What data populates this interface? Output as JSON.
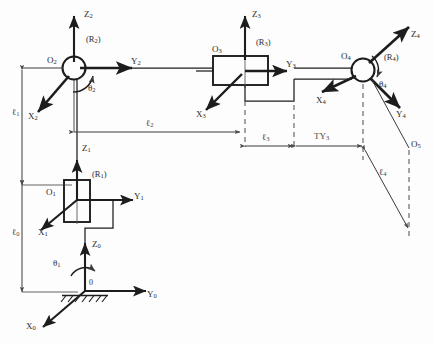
{
  "figure": {
    "type": "kinematic-diagram",
    "title": ""
  },
  "frames": [
    {
      "name": "R0",
      "label": "",
      "origin_label": "0",
      "axes": {
        "x": "X",
        "y": "Y",
        "z": "Z"
      },
      "sub": "0"
    },
    {
      "name": "R1",
      "label": "(R",
      "origin_label": "O",
      "sub": "1"
    },
    {
      "name": "R2",
      "label": "(R",
      "origin_label": "O",
      "sub": "2"
    },
    {
      "name": "R3",
      "label": "(R",
      "origin_label": "O",
      "sub": "3"
    },
    {
      "name": "R4",
      "label": "(R",
      "origin_label": "O",
      "sub": "4"
    },
    {
      "name": "O5",
      "origin_label": "O",
      "sub": "5"
    }
  ],
  "labels": {
    "frame_r1": "(R<sub>1</sub>)",
    "frame_r2": "(R<sub>2</sub>)",
    "frame_r3": "(R<sub>3</sub>)",
    "frame_r4": "(R<sub>4</sub>)",
    "origin_0": "0",
    "origin_o1": "O<sub>1</sub>",
    "origin_o2": "O<sub>2</sub>",
    "origin_o3": "O<sub>3</sub>",
    "origin_o4": "O<sub>4</sub>",
    "origin_o5": "O<sub>5</sub>",
    "axis_x0": "X<sub>0</sub>",
    "axis_y0": "Y<sub>0</sub>",
    "axis_z0": "Z<sub>0</sub>",
    "axis_x1": "X<sub>1</sub>",
    "axis_y1": "Y<sub>1</sub>",
    "axis_z1": "Z<sub>1</sub>",
    "axis_x2": "X<sub>2</sub>",
    "axis_y2": "Y<sub>2</sub>",
    "axis_z2": "Z<sub>2</sub>",
    "axis_x3": "X<sub>3</sub>",
    "axis_y3": "Y<sub>3</sub>",
    "axis_z3": "Z<sub>3</sub>",
    "axis_x4": "X<sub>4</sub>",
    "axis_y4": "Y<sub>4</sub>",
    "axis_z4": "Z<sub>4</sub>",
    "theta1": "θ<sub>1</sub>",
    "theta2": "θ<sub>2</sub>",
    "theta4": "θ<sub>4</sub>",
    "len_l0": "ℓ<sub>0</sub>",
    "len_l1": "ℓ<sub>1</sub>",
    "len_l2": "ℓ<sub>2</sub>",
    "len_l3": "ℓ<sub>3</sub>",
    "len_l4": "ℓ<sub>4</sub>",
    "dim_ty3": "TY<sub>3</sub>"
  },
  "dimensions": [
    {
      "name": "l0",
      "label": "ℓ<sub>0</sub>",
      "orientation": "vertical"
    },
    {
      "name": "l1",
      "label": "ℓ<sub>1</sub>",
      "orientation": "vertical"
    },
    {
      "name": "l2",
      "label": "ℓ<sub>2</sub>",
      "orientation": "horizontal"
    },
    {
      "name": "l3",
      "label": "ℓ<sub>3</sub>",
      "orientation": "horizontal"
    },
    {
      "name": "l4",
      "label": "ℓ<sub>4</sub>",
      "orientation": "diagonal"
    },
    {
      "name": "TY3",
      "label": "TY<sub>3</sub>",
      "orientation": "horizontal"
    }
  ],
  "colors": {
    "stroke": "#1d1d1d",
    "thin": "#5a5a5a",
    "dashed": "#6e6e6e",
    "text": "#2b2b2b",
    "background": "#fdfdfd"
  }
}
